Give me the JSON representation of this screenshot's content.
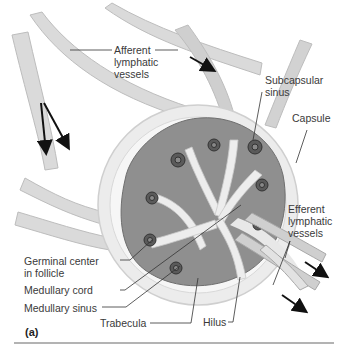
{
  "figure": {
    "panel_label": "(a)",
    "labels": {
      "afferent_line1": "Afferent",
      "afferent_line2": "lymphatic",
      "afferent_line3": "vessels",
      "subcapsular_line1": "Subcapsular",
      "subcapsular_line2": "sinus",
      "capsule": "Capsule",
      "efferent_line1": "Efferent",
      "efferent_line2": "lymphatic",
      "efferent_line3": "vessels",
      "germinal_line1": "Germinal center",
      "germinal_line2": "in follicle",
      "medullary_cord": "Medullary cord",
      "medullary_sinus": "Medullary sinus",
      "trabecula": "Trabecula",
      "hilus": "Hilus"
    }
  },
  "colors": {
    "vessel": "#d6d6d6",
    "vessel_edge": "#b8b8b8",
    "capsule": "#ececec",
    "tissue": "#8c8c8c",
    "tissue_light": "#a8a8a8",
    "follicle": "#555555",
    "arrow": "#111111",
    "leader": "#333333"
  }
}
